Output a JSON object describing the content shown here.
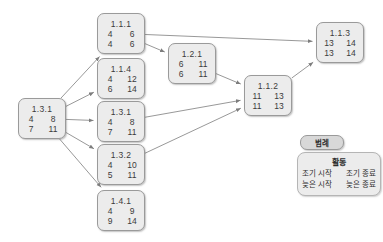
{
  "diagram": {
    "type": "precedence-network-diagram",
    "title": "",
    "nodes": [
      {
        "key": "start",
        "id": "1.3.1",
        "early_start": "4",
        "early_finish": "8",
        "late_start": "7",
        "late_finish": "11",
        "x": 18,
        "y": 98,
        "w": 48,
        "h": 41
      },
      {
        "key": "n111",
        "id": "1.1.1",
        "early_start": "4",
        "early_finish": "6",
        "late_start": "4",
        "late_finish": "6",
        "x": 97,
        "y": 13,
        "w": 48,
        "h": 41
      },
      {
        "key": "n114",
        "id": "1.1.4",
        "early_start": "4",
        "early_finish": "12",
        "late_start": "6",
        "late_finish": "14",
        "x": 97,
        "y": 58,
        "w": 48,
        "h": 41
      },
      {
        "key": "n131b",
        "id": "1.3.1",
        "early_start": "4",
        "early_finish": "8",
        "late_start": "7",
        "late_finish": "11",
        "x": 97,
        "y": 101,
        "w": 48,
        "h": 41
      },
      {
        "key": "n132",
        "id": "1.3.2",
        "early_start": "4",
        "early_finish": "10",
        "late_start": "5",
        "late_finish": "11",
        "x": 97,
        "y": 144,
        "w": 48,
        "h": 41
      },
      {
        "key": "n141",
        "id": "1.4.1",
        "early_start": "4",
        "early_finish": "9",
        "late_start": "9",
        "late_finish": "14",
        "x": 97,
        "y": 190,
        "w": 48,
        "h": 41
      },
      {
        "key": "n121",
        "id": "1.2.1",
        "early_start": "6",
        "early_finish": "11",
        "late_start": "6",
        "late_finish": "11",
        "x": 168,
        "y": 43,
        "w": 48,
        "h": 41
      },
      {
        "key": "n112",
        "id": "1.1.2",
        "early_start": "11",
        "early_finish": "13",
        "late_start": "11",
        "late_finish": "13",
        "x": 244,
        "y": 75,
        "w": 48,
        "h": 41
      },
      {
        "key": "n113",
        "id": "1.1.3",
        "early_start": "13",
        "early_finish": "14",
        "late_start": "13",
        "late_finish": "14",
        "x": 316,
        "y": 22,
        "w": 48,
        "h": 41
      }
    ],
    "edges": [
      {
        "from": "start",
        "to": "n111"
      },
      {
        "from": "start",
        "to": "n114"
      },
      {
        "from": "start",
        "to": "n131b"
      },
      {
        "from": "start",
        "to": "n132"
      },
      {
        "from": "start",
        "to": "n141"
      },
      {
        "from": "n111",
        "to": "n121"
      },
      {
        "from": "n111",
        "to": "n113"
      },
      {
        "from": "n121",
        "to": "n112"
      },
      {
        "from": "n131b",
        "to": "n112"
      },
      {
        "from": "n132",
        "to": "n112"
      },
      {
        "from": "n112",
        "to": "n113"
      }
    ]
  },
  "legend": {
    "pill_label": "범례",
    "title": "활동",
    "row1_left": "조기 시작",
    "row1_right": "조기 종료",
    "row2_left": "늦은 시작",
    "row2_right": "늦은 종료"
  },
  "colors": {
    "node_fill": "#ececec",
    "node_border": "#9a9a9a",
    "legend_pill_fill": "#d8d8d8",
    "edge": "#7d7d7d",
    "text": "#3b3b3b",
    "background": "#ffffff"
  }
}
